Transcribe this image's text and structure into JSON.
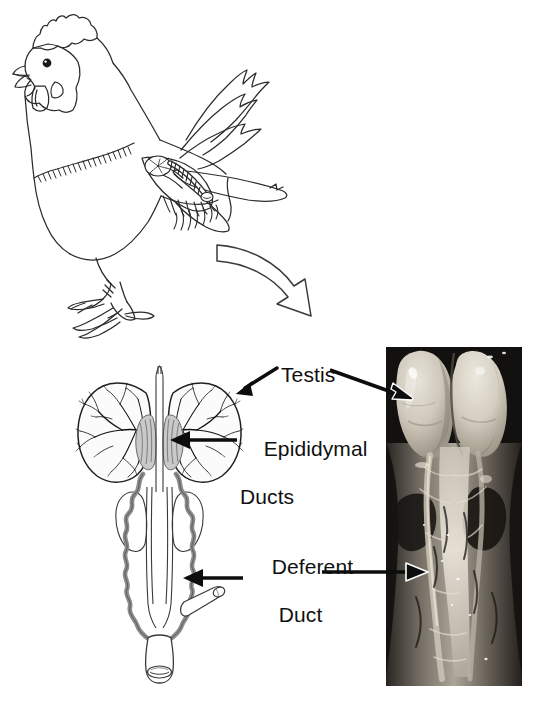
{
  "figure": {
    "background_color": "#ffffff",
    "width": 539,
    "height": 706
  },
  "top_panel": {
    "illustration": "rooster-line-drawing",
    "description": "Line drawing of a rooster in profile facing left with comb, wattle, beak, neck hackles, wings, tail feathers, legs and feet; internal reproductive organ sketched inside the body cavity",
    "organ_inset": "testis-and-duct-sketch",
    "transition_arrow": "curved-down-right-arrow"
  },
  "bottom_panel": {
    "diagram": {
      "name": "male-reproductive-tract-diagram",
      "parts": [
        "testis-left",
        "testis-right",
        "epididymal-ducts",
        "deferent-duct-left",
        "deferent-duct-right",
        "kidney-lobe-left",
        "kidney-lobe-right",
        "ureter",
        "cloaca",
        "papilla"
      ]
    },
    "photo": {
      "name": "dissection-photograph",
      "description": "Grayscale dissection photograph showing two pale testes at top and deferent ducts running down the midline",
      "left": 386,
      "top": 347,
      "width": 136,
      "height": 339
    }
  },
  "labels": {
    "testis": "Testis",
    "epididymal_line1": "Epididymal",
    "epididymal_line2": "Ducts",
    "deferent_line1": "Deferent",
    "deferent_line2": "Duct"
  },
  "annotations": {
    "arrows": [
      {
        "name": "testis-arrow-to-diagram",
        "from_label": "Testis",
        "points_to": "testis-right",
        "style": "solid-black-filled-head"
      },
      {
        "name": "testis-arrow-to-photo",
        "from_label": "Testis",
        "points_to": "photo-testis",
        "style": "solid-black-with-white-outline-head"
      },
      {
        "name": "epididymal-arrow-to-diagram",
        "from_label": "Epididymal Ducts",
        "points_to": "epididymal-ducts",
        "style": "solid-black-filled-head"
      },
      {
        "name": "deferent-arrow-to-diagram",
        "from_label": "Deferent Duct",
        "points_to": "deferent-duct-right",
        "style": "solid-black-filled-head"
      },
      {
        "name": "deferent-arrow-to-photo",
        "from_label": "Deferent Duct",
        "points_to": "photo-deferent-duct",
        "style": "solid-black-with-white-outline-head"
      }
    ]
  },
  "colors": {
    "ink": "#101010",
    "line": "#2b2b2b",
    "duct_gray": "#8d8d8d",
    "duct_gray_dark": "#6e6e6e",
    "organ_fill": "#f5f5f5",
    "epididymis_fill": "#c9c9c9",
    "photo_dark": "#141414",
    "photo_tissue": "#cfc8bf",
    "photo_testis": "#d7d2c7",
    "background": "#ffffff"
  }
}
